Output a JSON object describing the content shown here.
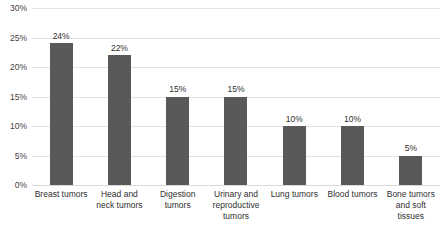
{
  "chart_data": {
    "type": "bar",
    "title": "",
    "xlabel": "",
    "ylabel": "",
    "ylim": [
      0,
      30
    ],
    "ytick_step": 5,
    "grid": true,
    "legend": "none",
    "value_suffix": "%",
    "bar_color": "#595959",
    "gridline_color": "#e3e3e3",
    "background_color": "#ffffff",
    "categories": [
      "Breast tumors",
      "Head and neck tumors",
      "Digestion tumors",
      "Urinary and reproductive tumors",
      "Lung tumors",
      "Blood tumors",
      "Bone tumors and soft tissues"
    ],
    "values": [
      24,
      22,
      15,
      15,
      10,
      10,
      5
    ],
    "data_labels": [
      "24%",
      "22%",
      "15%",
      "15%",
      "10%",
      "10%",
      "5%"
    ],
    "ytick_labels": [
      "0%",
      "5%",
      "10%",
      "15%",
      "20%",
      "25%",
      "30%"
    ],
    "ytick_values": [
      0,
      5,
      10,
      15,
      20,
      25,
      30
    ]
  }
}
